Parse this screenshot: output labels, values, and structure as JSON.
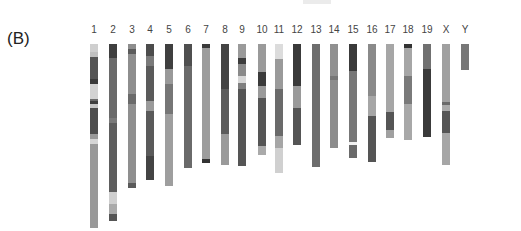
{
  "panel_label": "(B)",
  "top_y": 44,
  "chromosomes": [
    {
      "label": "1",
      "x": 94,
      "bottom": 228,
      "bands": [
        [
          "#cfcfcf",
          8
        ],
        [
          "#c0c0c0",
          5
        ],
        [
          "#555",
          22
        ],
        [
          "#3a3a3a",
          5
        ],
        [
          "#d2d2d2",
          15
        ],
        [
          "#6b6b6b",
          2
        ],
        [
          "#3f3f3f",
          3
        ],
        [
          "#c8c8c8",
          4
        ],
        [
          "#4e4e4e",
          26
        ],
        [
          "#9a9a9a",
          5
        ],
        [
          "#d5d5d5",
          5
        ],
        [
          "#999",
          84
        ]
      ]
    },
    {
      "label": "2",
      "x": 113,
      "bottom": 221,
      "bands": [
        [
          "#3f3f3f",
          14
        ],
        [
          "#6a6a6a",
          60
        ],
        [
          "#7a7a7a",
          5
        ],
        [
          "#5e5e5e",
          69
        ],
        [
          "#cfcfcf",
          12
        ],
        [
          "#aaa",
          10
        ],
        [
          "#555",
          7
        ]
      ]
    },
    {
      "label": "3",
      "x": 132,
      "bottom": 188,
      "bands": [
        [
          "#8d8d8d",
          5
        ],
        [
          "#5b5b5b",
          5
        ],
        [
          "#8e8e8e",
          40
        ],
        [
          "#6a6a6a",
          10
        ],
        [
          "#8f8f8f",
          79
        ],
        [
          "#5a5a5a",
          5
        ]
      ]
    },
    {
      "label": "4",
      "x": 150,
      "bottom": 180,
      "bands": [
        [
          "#4c4c4c",
          12
        ],
        [
          "#7a7a7a",
          10
        ],
        [
          "#5a5a5a",
          35
        ],
        [
          "#9a9a9a",
          10
        ],
        [
          "#5a5a5a",
          45
        ],
        [
          "#444",
          24
        ]
      ]
    },
    {
      "label": "5",
      "x": 169,
      "bottom": 186,
      "bands": [
        [
          "#3f3f3f",
          25
        ],
        [
          "#999",
          15
        ],
        [
          "#767676",
          30
        ],
        [
          "#9e9e9e",
          72
        ]
      ]
    },
    {
      "label": "6",
      "x": 188,
      "bottom": 168,
      "bands": [
        [
          "#4f4f4f",
          22
        ],
        [
          "#6a6a6a",
          102
        ]
      ]
    },
    {
      "label": "7",
      "x": 206,
      "bottom": 163,
      "bands": [
        [
          "#3a3a3a",
          4
        ],
        [
          "#9c9c9c",
          111
        ],
        [
          "#333",
          4
        ]
      ]
    },
    {
      "label": "8",
      "x": 225,
      "bottom": 165,
      "bands": [
        [
          "#444",
          45
        ],
        [
          "#5c5c5c",
          45
        ],
        [
          "#9a9a9a",
          31
        ]
      ]
    },
    {
      "label": "9",
      "x": 242,
      "bottom": 166,
      "bands": [
        [
          "#9a9a9a",
          14
        ],
        [
          "#3c3c3c",
          6
        ],
        [
          "#8a8a8a",
          12
        ],
        [
          "#d6d6d6",
          7
        ],
        [
          "#7f7f7f",
          6
        ],
        [
          "#555",
          77
        ]
      ]
    },
    {
      "label": "10",
      "x": 262,
      "bottom": 155,
      "bands": [
        [
          "#9a9a9a",
          28
        ],
        [
          "#3a3a3a",
          14
        ],
        [
          "#9a9a9a",
          12
        ],
        [
          "#555",
          48
        ],
        [
          "#aaa",
          9
        ]
      ]
    },
    {
      "label": "11",
      "x": 279,
      "bottom": 173,
      "bands": [
        [
          "#dcdcdc",
          15
        ],
        [
          "#9a9a9a",
          30
        ],
        [
          "#6a6a6a",
          47
        ],
        [
          "#a6a6a6",
          12
        ],
        [
          "#d0d0d0",
          25
        ]
      ]
    },
    {
      "label": "12",
      "x": 297,
      "bottom": 145,
      "bands": [
        [
          "#3a3a3a",
          42
        ],
        [
          "#9a9a9a",
          22
        ],
        [
          "#555",
          37
        ]
      ]
    },
    {
      "label": "13",
      "x": 316,
      "bottom": 167,
      "bands": [
        [
          "#6d6d6d",
          123
        ]
      ]
    },
    {
      "label": "14",
      "x": 334,
      "bottom": 148,
      "bands": [
        [
          "#909090",
          32
        ],
        [
          "#777",
          4
        ],
        [
          "#8c8c8c",
          68
        ]
      ]
    },
    {
      "label": "15",
      "x": 353,
      "bottom": 158,
      "bands": [
        [
          "#3a3a3a",
          27
        ],
        [
          "#777",
          71
        ],
        [
          "#f2f2f2",
          3
        ],
        [
          "#6a6a6a",
          13
        ]
      ]
    },
    {
      "label": "16",
      "x": 372,
      "bottom": 162,
      "bands": [
        [
          "#8a8a8a",
          52
        ],
        [
          "#a6a6a6",
          20
        ],
        [
          "#555",
          46
        ]
      ]
    },
    {
      "label": "17",
      "x": 390,
      "bottom": 138,
      "bands": [
        [
          "#a6a6a6",
          68
        ],
        [
          "#555",
          18
        ],
        [
          "#a0a0a0",
          8
        ]
      ]
    },
    {
      "label": "18",
      "x": 408,
      "bottom": 140,
      "bands": [
        [
          "#333",
          4
        ],
        [
          "#a6a6a6",
          28
        ],
        [
          "#7a7a7a",
          28
        ],
        [
          "#a8a8a8",
          36
        ]
      ]
    },
    {
      "label": "19",
      "x": 427,
      "bottom": 137,
      "bands": [
        [
          "#707070",
          25
        ],
        [
          "#3a3a3a",
          68
        ]
      ]
    },
    {
      "label": "X",
      "x": 446,
      "bottom": 165,
      "bands": [
        [
          "#a0a0a0",
          58
        ],
        [
          "#6a6a6a",
          3
        ],
        [
          "#aaa",
          6
        ],
        [
          "#555",
          22
        ],
        [
          "#a6a6a6",
          32
        ]
      ]
    },
    {
      "label": "Y",
      "x": 465,
      "bottom": 70,
      "bands": [
        [
          "#777",
          26
        ]
      ]
    }
  ]
}
